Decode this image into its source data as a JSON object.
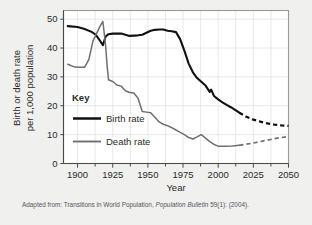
{
  "figure": {
    "background_color": "#f0f0ef",
    "plot_background_color": "#ffffff",
    "frame_color": "#9a9a9a",
    "grid_color": "#e2e2e2"
  },
  "axes": {
    "y_axis_title_line1": "Birth or death rate",
    "y_axis_title_line2": "per 1,000 population",
    "x_axis_title": "Year",
    "y_ticks": [
      "0",
      "10",
      "20",
      "30",
      "40",
      "50"
    ],
    "x_ticks": [
      "1900",
      "1925",
      "1950",
      "1975",
      "2000",
      "2025",
      "2050"
    ],
    "y_range": [
      0,
      53
    ],
    "x_range": [
      1890,
      2050
    ],
    "x_minor_tick_step": 12.5,
    "grid": "vertical-and-horizontal-light"
  },
  "legend": {
    "title": "Key",
    "items": [
      {
        "label": "Birth rate",
        "color": "#111111",
        "width": 2.1
      },
      {
        "label": "Death rate",
        "color": "#6f6f6f",
        "width": 1.5
      }
    ]
  },
  "caption": {
    "prefix": "Adapted from: Transitions in World Population, ",
    "italic": "Population Bulletin",
    "suffix": " 59(1): (2004)."
  },
  "chart_data": {
    "type": "line",
    "title": "",
    "xlabel": "Year",
    "ylabel": "Birth or death rate per 1,000 population",
    "xlim": [
      1890,
      2050
    ],
    "ylim": [
      0,
      53
    ],
    "grid": true,
    "legend_position": "inside-left-middle",
    "annotations": [
      "Death rate spike near 1918 (influenza pandemic) reaching ~49",
      "Birth rate dip near 1918 to ~41",
      "Dashed segments after 2015 are projections"
    ],
    "series": [
      {
        "name": "Birth rate",
        "color": "#111111",
        "style": "solid-then-dashed",
        "dash_begins_x": 2015,
        "x": [
          1893,
          1900,
          1905,
          1910,
          1913,
          1915,
          1918,
          1920,
          1922,
          1925,
          1928,
          1931,
          1934,
          1937,
          1940,
          1943,
          1946,
          1949,
          1952,
          1955,
          1958,
          1961,
          1964,
          1967,
          1970,
          1973,
          1976,
          1979,
          1982,
          1985,
          1988,
          1991,
          1994,
          1995,
          1997,
          2000,
          2003,
          2006,
          2009,
          2012,
          2015,
          2020,
          2025,
          2030,
          2035,
          2040,
          2045,
          2050
        ],
        "y": [
          47.6,
          47.3,
          46.6,
          45.6,
          44.6,
          43.2,
          41.0,
          44.0,
          44.8,
          45.0,
          45.0,
          45.0,
          44.6,
          44.2,
          44.3,
          44.4,
          44.6,
          45.3,
          46.0,
          46.3,
          46.4,
          46.4,
          46.0,
          45.8,
          45.5,
          43.0,
          39.0,
          34.6,
          31.6,
          29.6,
          28.3,
          27.0,
          24.8,
          25.6,
          23.4,
          22.2,
          21.2,
          20.3,
          19.5,
          18.6,
          17.6,
          16.2,
          15.2,
          14.5,
          13.9,
          13.5,
          13.2,
          13.0
        ]
      },
      {
        "name": "Death rate",
        "color": "#6f6f6f",
        "style": "solid-then-dashed",
        "dash_begins_x": 2015,
        "x": [
          1893,
          1898,
          1902,
          1905,
          1908,
          1911,
          1914,
          1916,
          1918,
          1919,
          1920,
          1921,
          1922,
          1925,
          1928,
          1931,
          1934,
          1937,
          1940,
          1943,
          1946,
          1949,
          1952,
          1955,
          1958,
          1961,
          1964,
          1967,
          1970,
          1973,
          1976,
          1979,
          1982,
          1985,
          1988,
          1991,
          1994,
          1997,
          2000,
          2005,
          2010,
          2015,
          2020,
          2025,
          2030,
          2035,
          2040,
          2045,
          2050
        ],
        "y": [
          34.4,
          33.4,
          33.3,
          33.3,
          36.0,
          42.5,
          45.5,
          47.6,
          49.2,
          45.0,
          40.5,
          34.0,
          29.0,
          28.4,
          27.2,
          26.8,
          25.2,
          24.6,
          24.4,
          22.6,
          18.0,
          17.8,
          17.6,
          16.0,
          14.4,
          13.6,
          13.1,
          12.4,
          11.6,
          10.8,
          10.0,
          9.0,
          8.5,
          9.2,
          10.0,
          8.8,
          7.6,
          6.6,
          6.0,
          6.0,
          6.1,
          6.3,
          6.7,
          7.1,
          7.6,
          8.1,
          8.6,
          9.0,
          9.4
        ]
      }
    ]
  }
}
